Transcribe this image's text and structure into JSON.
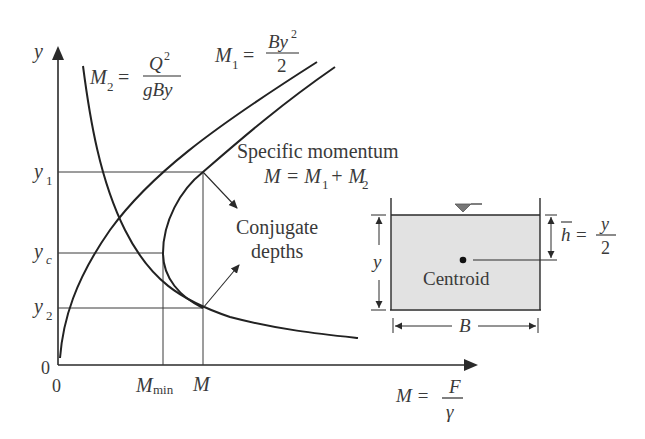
{
  "diagram": {
    "axes": {
      "y_label": "y",
      "x_label_lhs": "M =",
      "x_label_num": "F",
      "x_label_den": "γ",
      "origin_x": "0",
      "origin_y": "0"
    },
    "y_ticks": {
      "y1": {
        "base": "y",
        "sub": "1"
      },
      "yc": {
        "base": "y",
        "sub": "c"
      },
      "y2": {
        "base": "y",
        "sub": "2"
      }
    },
    "x_ticks": {
      "mmin": {
        "base": "M",
        "sub": "min"
      },
      "m": "M"
    },
    "curves": {
      "m2": {
        "lhs": "M",
        "sub": "2",
        "eq": "=",
        "num": "Q",
        "num_sup": "2",
        "den": "gBy"
      },
      "m1": {
        "lhs": "M",
        "sub": "1",
        "eq": "=",
        "num": "By",
        "num_sup": "2",
        "den": "2"
      },
      "specific_momentum": {
        "title": "Specific momentum",
        "eq_lhs": "M = M",
        "eq_sub1": "1",
        "eq_plus": "+ M",
        "eq_sub2": "2"
      }
    },
    "annotations": {
      "conjugate_line1": "Conjugate",
      "conjugate_line2": "depths"
    },
    "channel": {
      "centroid_label": "Centroid",
      "depth_label": "y",
      "width_label": "B",
      "hbar_label": "h",
      "hbar_eq": "=",
      "hbar_num": "y",
      "hbar_den": "2",
      "fill_color": "#e2e2e2"
    },
    "colors": {
      "line": "#2a2a2a",
      "text": "#3a3a3a",
      "background": "#ffffff"
    }
  }
}
